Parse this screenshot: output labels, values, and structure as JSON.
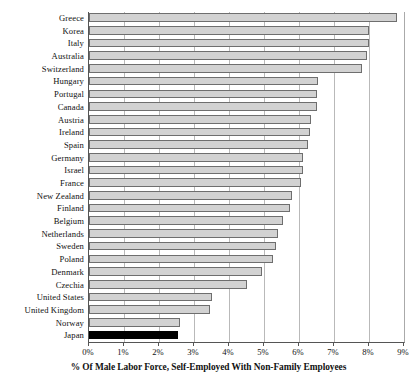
{
  "chart_data": {
    "type": "bar",
    "orientation": "horizontal",
    "title": "",
    "xlabel": "% Of Male Labor Force, Self-Employed With Non-Family Employees",
    "ylabel": "",
    "xlim": [
      0,
      9
    ],
    "xtick_labels": [
      "0%",
      "1%",
      "2%",
      "3%",
      "4%",
      "5%",
      "6%",
      "7%",
      "8%",
      "9%"
    ],
    "xtick_values": [
      0,
      1,
      2,
      3,
      4,
      5,
      6,
      7,
      8,
      9
    ],
    "grid": true,
    "legend": "none",
    "bar_color": "#d2d2d2",
    "bar_edge_color": "#6e6e6e",
    "highlight_color": "#000000",
    "highlight_category": "Japan",
    "categories": [
      "Greece",
      "Korea",
      "Italy",
      "Australia",
      "Switzerland",
      "Hungary",
      "Portugal",
      "Canada",
      "Austria",
      "Ireland",
      "Spain",
      "Germany",
      "Israel",
      "France",
      "New Zealand",
      "Finland",
      "Belgium",
      "Netherlands",
      "Sweden",
      "Poland",
      "Denmark",
      "Czechia",
      "United States",
      "United Kingdom",
      "Norway",
      "Japan"
    ],
    "values": [
      8.8,
      8.0,
      8.0,
      7.95,
      7.8,
      6.55,
      6.5,
      6.5,
      6.35,
      6.3,
      6.25,
      6.1,
      6.1,
      6.05,
      5.8,
      5.75,
      5.55,
      5.4,
      5.35,
      5.25,
      4.95,
      4.5,
      3.5,
      3.45,
      2.6,
      2.55
    ]
  },
  "axis": {
    "x_title": "% Of Male Labor Force, Self-Employed With Non-Family Employees"
  }
}
